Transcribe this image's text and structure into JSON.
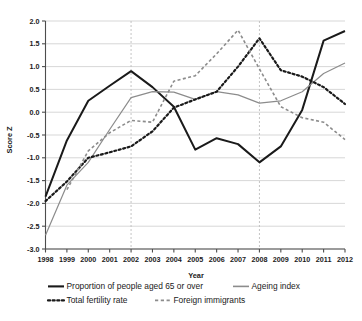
{
  "chart_data": {
    "type": "line",
    "title": "",
    "xlabel": "Year",
    "ylabel": "Score Z",
    "x": [
      1998,
      1999,
      2000,
      2001,
      2002,
      2003,
      2004,
      2005,
      2006,
      2007,
      2008,
      2009,
      2010,
      2011,
      2012
    ],
    "xlim": [
      1998,
      2012
    ],
    "ylim": [
      -3.0,
      2.0
    ],
    "yticks": [
      2.0,
      1.5,
      1.0,
      0.5,
      0.0,
      -0.5,
      -1.0,
      -1.5,
      -2.0,
      -2.5,
      -3.0
    ],
    "ytick_labels": [
      "2.0",
      "1.5",
      "1.0",
      "0.5",
      "0.0",
      "-0.5",
      "-1.0",
      "-1.5",
      "-2.0",
      "-2.5",
      "-3.0"
    ],
    "xtick_labels": [
      "1998",
      "1999",
      "2000",
      "2001",
      "2002",
      "2003",
      "2004",
      "2005",
      "2006",
      "2007",
      "2008",
      "2009",
      "2010",
      "2011",
      "2012"
    ],
    "grid": "horizontal",
    "legend_position": "below",
    "vertical_reference_lines": [
      2002,
      2008
    ],
    "series": [
      {
        "name": "Proportion of people aged 65 or over",
        "style": "solid",
        "color": "#1a1a1a",
        "width": 2.0,
        "values": [
          -1.85,
          -0.62,
          0.25,
          0.58,
          0.9,
          0.55,
          0.12,
          -0.82,
          -0.57,
          -0.7,
          -1.1,
          -0.75,
          0.05,
          1.57,
          1.78
        ]
      },
      {
        "name": "Ageing index",
        "style": "solid",
        "color": "#8c8c8c",
        "width": 1.2,
        "values": [
          -2.7,
          -1.6,
          -1.1,
          -0.38,
          0.32,
          0.45,
          0.44,
          0.28,
          0.45,
          0.38,
          0.2,
          0.25,
          0.45,
          0.85,
          1.08
        ]
      },
      {
        "name": "Total fertility rate",
        "style": "dotted",
        "color": "#1a1a1a",
        "width": 2.2,
        "values": [
          -1.95,
          -1.52,
          -1.0,
          -0.88,
          -0.75,
          -0.42,
          0.1,
          0.28,
          0.45,
          1.0,
          1.62,
          0.92,
          0.78,
          0.55,
          0.18
        ]
      },
      {
        "name": "Foreign immigrants",
        "style": "dashed",
        "color": "#8c8c8c",
        "width": 1.6,
        "values": [
          null,
          -1.7,
          -0.85,
          -0.45,
          -0.18,
          -0.22,
          0.68,
          0.8,
          1.28,
          1.8,
          0.95,
          0.12,
          -0.12,
          -0.22,
          -0.6
        ]
      }
    ]
  },
  "legend": {
    "items": [
      {
        "label": "Proportion of people aged 65 or over",
        "style": "solid",
        "color": "#1a1a1a"
      },
      {
        "label": "Ageing index",
        "style": "solid",
        "color": "#8c8c8c"
      },
      {
        "label": "Total fertility rate",
        "style": "dotted",
        "color": "#1a1a1a"
      },
      {
        "label": "Foreign immigrants",
        "style": "dashed",
        "color": "#8c8c8c"
      }
    ]
  },
  "axes": {
    "y_title": "Score Z",
    "x_title": "Year"
  }
}
